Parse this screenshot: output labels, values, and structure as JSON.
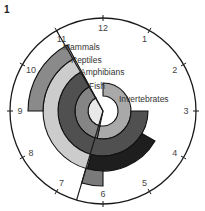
{
  "figure": {
    "label": "1"
  },
  "clock": {
    "center": [
      103,
      111
    ],
    "radius": 93,
    "hour_labels": [
      "12",
      "1",
      "2",
      "3",
      "4",
      "5",
      "6",
      "7",
      "8",
      "9",
      "10",
      "11"
    ],
    "divider_start_hour": 11,
    "divider_end_hour": 6.55
  },
  "rings": [
    {
      "name": "Invertebrates",
      "color": "#aaaaaa",
      "r_inner": 0,
      "r_outer": 15,
      "start_hour": 6.4,
      "end_hour": 11.05,
      "fill_override": "#e8e8e8"
    },
    {
      "name": "Invertebrates",
      "color": "#a9a9a9",
      "r_inner": 15,
      "r_outer": 28,
      "start_hour": 0,
      "end_hour": 6.4
    },
    {
      "name": "Fish",
      "color": "#858585",
      "r_inner": 15,
      "r_outer": 28,
      "start_hour": 6.4,
      "end_hour": 11.05
    },
    {
      "name": "Amphibians",
      "color": "#505050",
      "r_inner": 28,
      "r_outer": 45,
      "start_hour": 3,
      "end_hour": 11.05
    },
    {
      "name": "Reptiles",
      "color": "#cccccc",
      "r_inner": 45,
      "r_outer": 60,
      "start_hour": 6.5,
      "end_hour": 11.05
    },
    {
      "name": "Reptiles-late",
      "color": "#1e1e1e",
      "r_inner": 45,
      "r_outer": 60,
      "start_hour": 4,
      "end_hour": 6.5
    },
    {
      "name": "Mammals",
      "color": "#8a8a8a",
      "r_inner": 60,
      "r_outer": 75,
      "start_hour": 9,
      "end_hour": 11.05
    },
    {
      "name": "Mammals-early",
      "color": "#7a7a7a",
      "r_inner": 60,
      "r_outer": 75,
      "start_hour": 6,
      "end_hour": 6.55
    }
  ],
  "labels": [
    {
      "text": "Mammals",
      "x": 63,
      "y": 50
    },
    {
      "text": "Reptiles",
      "x": 71,
      "y": 63
    },
    {
      "text": "Amphibians",
      "x": 80,
      "y": 75
    },
    {
      "text": "Fish",
      "x": 89,
      "y": 89
    },
    {
      "text": "Invertebrates",
      "x": 119,
      "y": 102
    }
  ]
}
